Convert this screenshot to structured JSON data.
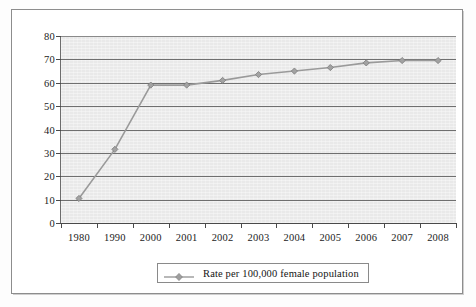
{
  "chart_data": {
    "type": "line",
    "title": "",
    "subtitle": "",
    "xlabel": "",
    "ylabel": "",
    "categories": [
      "1980",
      "1990",
      "2000",
      "2001",
      "2002",
      "2003",
      "2004",
      "2005",
      "2006",
      "2007",
      "2008"
    ],
    "series": [
      {
        "name": "Rate per 100,000 female population",
        "values": [
          10.5,
          31.5,
          59.0,
          59.0,
          61.0,
          63.5,
          65.0,
          66.5,
          68.5,
          69.5,
          69.5
        ],
        "marker": "diamond",
        "color": "#9a9a9a"
      }
    ],
    "ylim": [
      0,
      80
    ],
    "yticks": [
      0,
      10,
      20,
      30,
      40,
      50,
      60,
      70,
      80
    ],
    "ytick_labels": [
      "0",
      "10",
      "20",
      "30",
      "40",
      "50",
      "60",
      "70",
      "80"
    ],
    "grid": true,
    "grid_axis": "y",
    "legend_position": "bottom",
    "plot_background": "#e9e9e9",
    "gridline_color": "#6f6f6f",
    "axis_color": "#4a4a4a",
    "frame_color": "#8d8d8d"
  },
  "legend": {
    "entries": [
      {
        "label": "Rate per 100,000 female population",
        "marker": "diamond",
        "color": "#9a9a9a"
      }
    ]
  }
}
